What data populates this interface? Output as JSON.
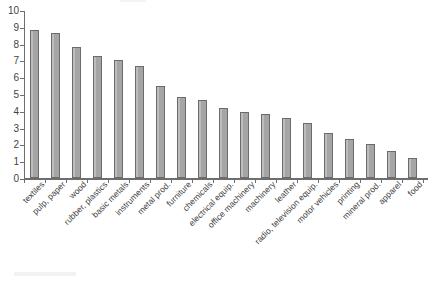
{
  "chart_data": {
    "type": "bar",
    "title": "",
    "subtitle": "",
    "xlabel": "",
    "ylabel": "",
    "ylim": [
      0,
      10
    ],
    "yticks": [
      0,
      1,
      2,
      3,
      4,
      5,
      6,
      7,
      8,
      9,
      10
    ],
    "grid": false,
    "legend": null,
    "orientation": "vertical",
    "sorted": "descending",
    "bar_color": "#a9a9a9",
    "bar_edge_color": "#6b6b6b",
    "axis_color": "#6e6e6e",
    "background_color": "#ffffff",
    "label_rotation": -45,
    "categories": [
      "textiles",
      "pulp, paper",
      "wood",
      "rubber, plastics",
      "basic metals",
      "instruments",
      "metal prod.",
      "furniture",
      "chemicals",
      "electrical equip.",
      "office machinery",
      "machinery",
      "leather",
      "radio, television equip.",
      "motor vehicles",
      "printing",
      "mineral prod.",
      "apparel",
      "food"
    ],
    "values": [
      8.8,
      8.65,
      7.8,
      7.25,
      7.0,
      6.65,
      5.5,
      4.85,
      4.65,
      4.15,
      3.9,
      3.8,
      3.6,
      3.25,
      2.65,
      2.35,
      2.0,
      1.6,
      1.2
    ]
  }
}
